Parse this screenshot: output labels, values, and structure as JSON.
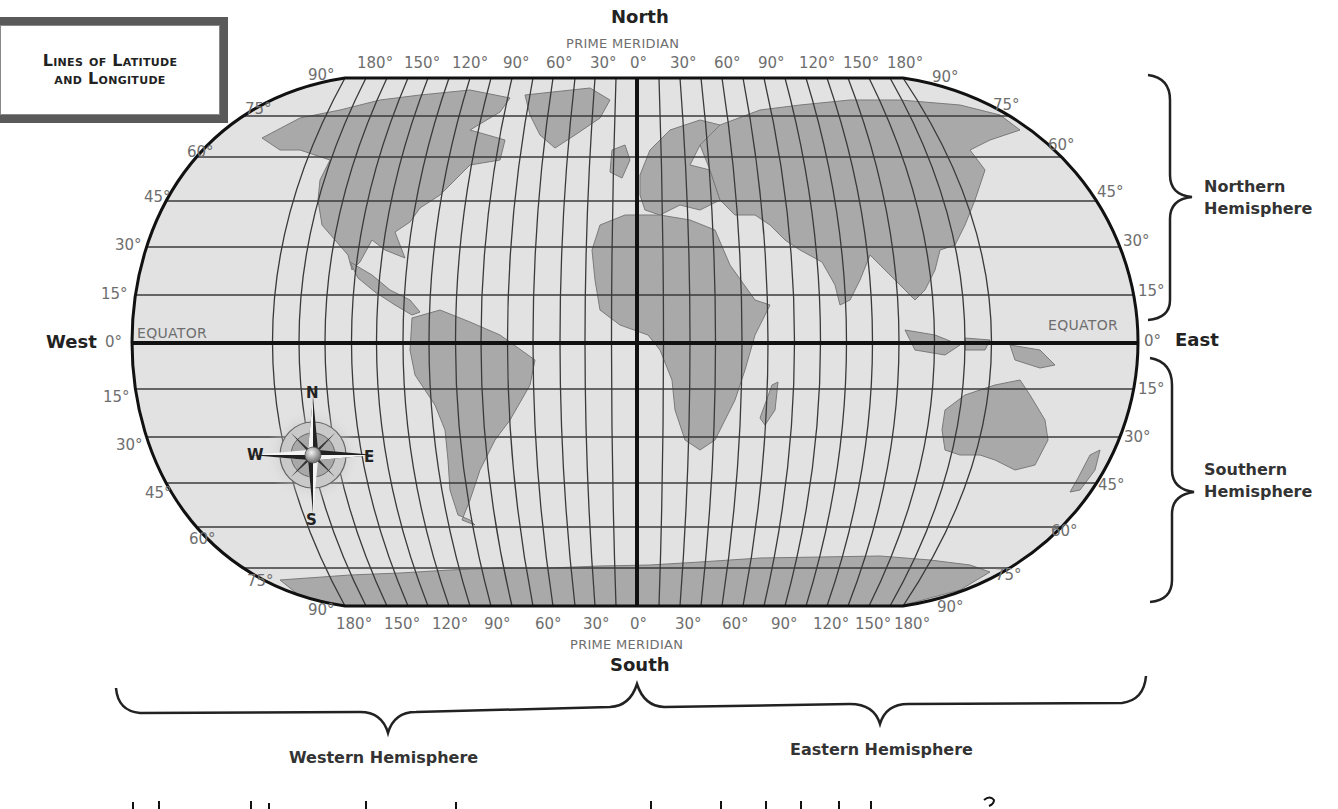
{
  "title": {
    "line1": "Lines of Latitude",
    "line2": "and Longitude"
  },
  "directions": {
    "north": "North",
    "south": "South",
    "east": "East",
    "west": "West"
  },
  "prime_meridian": {
    "top_label": "PRIME MERIDIAN",
    "bottom_label": "PRIME MERIDIAN"
  },
  "equator": {
    "left_label": "EQUATOR",
    "right_label": "EQUATOR"
  },
  "longitude_labels_top": [
    "180°",
    "150°",
    "120°",
    "90°",
    "60°",
    "30°",
    "0°",
    "30°",
    "60°",
    "90°",
    "120°",
    "150°",
    "180°"
  ],
  "longitude_labels_bottom": [
    "180°",
    "150°",
    "120°",
    "90°",
    "60°",
    "30°",
    "0°",
    "30°",
    "60°",
    "90°",
    "120°",
    "150°",
    "180°"
  ],
  "latitude_labels_left": {
    "north": [
      "90°",
      "75°",
      "60°",
      "45°",
      "30°",
      "15°"
    ],
    "equator": "0°",
    "south": [
      "15°",
      "30°",
      "45°",
      "60°",
      "75°",
      "90°"
    ]
  },
  "latitude_labels_right": {
    "north": [
      "90°",
      "75°",
      "60°",
      "45°",
      "30°",
      "15°"
    ],
    "equator": "0°",
    "south": [
      "15°",
      "30°",
      "45°",
      "60°",
      "75°",
      "90°"
    ]
  },
  "hemispheres": {
    "northern": [
      "Northern",
      "Hemisphere"
    ],
    "southern": [
      "Southern",
      "Hemisphere"
    ],
    "western": "Western Hemisphere",
    "eastern": "Eastern Hemisphere"
  },
  "compass_rose": {
    "n": "N",
    "s": "S",
    "e": "E",
    "w": "W"
  },
  "colors": {
    "ocean": "#e2e2e2",
    "land": "#a9a9a9",
    "grid": "#3a3a3a",
    "outline": "#111111",
    "label_gray": "#6e6e6e",
    "title_border": "#5a5a5a"
  }
}
